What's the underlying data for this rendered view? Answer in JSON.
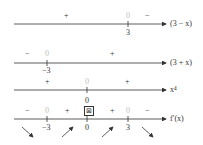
{
  "rows": [
    {
      "label": "(3 − x)",
      "signs": [
        "+",
        "0",
        "−"
      ],
      "ticks": [
        "3"
      ]
    },
    {
      "label": "(3 + x)",
      "signs": [
        "−",
        "0",
        "+"
      ],
      "ticks": [
        "−3"
      ]
    },
    {
      "label": "x⁴",
      "signs": [
        "+",
        "0",
        "+"
      ],
      "ticks": [
        "0"
      ]
    },
    {
      "label": "f′(x)",
      "signs": [
        "−",
        "0",
        "+",
        "⊠",
        "+",
        "0",
        "−"
      ],
      "ticks": [
        "−3",
        "0",
        "3"
      ]
    }
  ],
  "colors": {
    "line": "#333333",
    "zero": "#bbbbbb"
  }
}
